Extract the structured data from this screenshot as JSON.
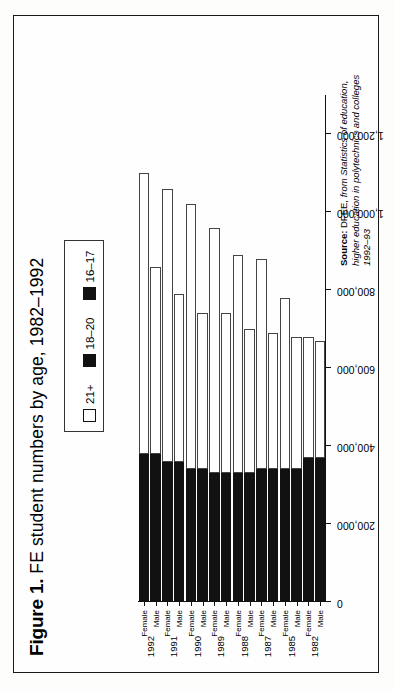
{
  "figure": {
    "label": "Figure 1.",
    "title": "FE student numbers by age, 1982–1992"
  },
  "legend": {
    "items": [
      {
        "label": "21+",
        "swatch": "open",
        "color": "#ffffff"
      },
      {
        "label": "18–20",
        "swatch": "solid",
        "color": "#111111"
      },
      {
        "label": "16–17",
        "swatch": "solid",
        "color": "#111111"
      }
    ]
  },
  "source": {
    "prefix": "Source:",
    "agency": " DFEE, ",
    "publication": "from Statistics of education, higher education in polytechnics and colleges 1992–93"
  },
  "chart_data": {
    "type": "bar",
    "orientation": "horizontal",
    "stacked": true,
    "title": "FE student numbers by age, 1982–1992",
    "xlabel": "",
    "ylabel": "",
    "xlim": [
      0,
      1300000
    ],
    "grid": false,
    "legend_position": "top-right",
    "xticks": [
      0,
      200000,
      400000,
      600000,
      800000,
      1000000,
      1200000
    ],
    "xticklabels": [
      "0",
      "200,000",
      "400,000",
      "600,000",
      "800,000",
      "1,000,000",
      "1,200,000"
    ],
    "years": [
      "1982",
      "1985",
      "1987",
      "1988",
      "1989",
      "1990",
      "1991",
      "1992"
    ],
    "categories": [
      "1982 Male",
      "1982 Female",
      "1985 Male",
      "1985 Female",
      "1987 Male",
      "1987 Female",
      "1988 Male",
      "1988 Female",
      "1989 Male",
      "1989 Female",
      "1990 Male",
      "1990 Female",
      "1991 Male",
      "1991 Female",
      "1992 Male",
      "1992 Female"
    ],
    "series": [
      {
        "name": "16–17",
        "color": "#111111",
        "values": [
          330000,
          330000,
          300000,
          300000,
          300000,
          300000,
          290000,
          290000,
          290000,
          290000,
          300000,
          300000,
          320000,
          320000,
          340000,
          340000
        ]
      },
      {
        "name": "18–20",
        "color": "#111111",
        "values": [
          40000,
          40000,
          40000,
          40000,
          40000,
          40000,
          40000,
          40000,
          40000,
          40000,
          40000,
          40000,
          40000,
          40000,
          40000,
          40000
        ]
      },
      {
        "name": "21+",
        "color": "#ffffff",
        "values": [
          300000,
          310000,
          340000,
          440000,
          350000,
          540000,
          370000,
          560000,
          410000,
          630000,
          400000,
          680000,
          430000,
          700000,
          480000,
          720000
        ]
      }
    ],
    "bars": [
      {
        "category": "1982 Male",
        "year": "1982",
        "sex": "Male",
        "s1617": 330000,
        "s1820": 40000,
        "s21": 300000,
        "total": 670000
      },
      {
        "category": "1982 Female",
        "year": "1982",
        "sex": "Female",
        "s1617": 330000,
        "s1820": 40000,
        "s21": 310000,
        "total": 680000
      },
      {
        "category": "1985 Male",
        "year": "1985",
        "sex": "Male",
        "s1617": 300000,
        "s1820": 40000,
        "s21": 340000,
        "total": 680000
      },
      {
        "category": "1985 Female",
        "year": "1985",
        "sex": "Female",
        "s1617": 300000,
        "s1820": 40000,
        "s21": 440000,
        "total": 780000
      },
      {
        "category": "1987 Male",
        "year": "1987",
        "sex": "Male",
        "s1617": 300000,
        "s1820": 40000,
        "s21": 350000,
        "total": 690000
      },
      {
        "category": "1987 Female",
        "year": "1987",
        "sex": "Female",
        "s1617": 300000,
        "s1820": 40000,
        "s21": 540000,
        "total": 880000
      },
      {
        "category": "1988 Male",
        "year": "1988",
        "sex": "Male",
        "s1617": 290000,
        "s1820": 40000,
        "s21": 370000,
        "total": 700000
      },
      {
        "category": "1988 Female",
        "year": "1988",
        "sex": "Female",
        "s1617": 290000,
        "s1820": 40000,
        "s21": 560000,
        "total": 890000
      },
      {
        "category": "1989 Male",
        "year": "1989",
        "sex": "Male",
        "s1617": 290000,
        "s1820": 40000,
        "s21": 410000,
        "total": 740000
      },
      {
        "category": "1989 Female",
        "year": "1989",
        "sex": "Female",
        "s1617": 290000,
        "s1820": 40000,
        "s21": 630000,
        "total": 960000
      },
      {
        "category": "1990 Male",
        "year": "1990",
        "sex": "Male",
        "s1617": 300000,
        "s1820": 40000,
        "s21": 400000,
        "total": 740000
      },
      {
        "category": "1990 Female",
        "year": "1990",
        "sex": "Female",
        "s1617": 300000,
        "s1820": 40000,
        "s21": 680000,
        "total": 1020000
      },
      {
        "category": "1991 Male",
        "year": "1991",
        "sex": "Male",
        "s1617": 320000,
        "s1820": 40000,
        "s21": 430000,
        "total": 790000
      },
      {
        "category": "1991 Female",
        "year": "1991",
        "sex": "Female",
        "s1617": 320000,
        "s1820": 40000,
        "s21": 700000,
        "total": 1060000
      },
      {
        "category": "1992 Male",
        "year": "1992",
        "sex": "Male",
        "s1617": 340000,
        "s1820": 40000,
        "s21": 480000,
        "total": 860000
      },
      {
        "category": "1992 Female",
        "year": "1992",
        "sex": "Female",
        "s1617": 340000,
        "s1820": 40000,
        "s21": 720000,
        "total": 1100000
      }
    ]
  }
}
